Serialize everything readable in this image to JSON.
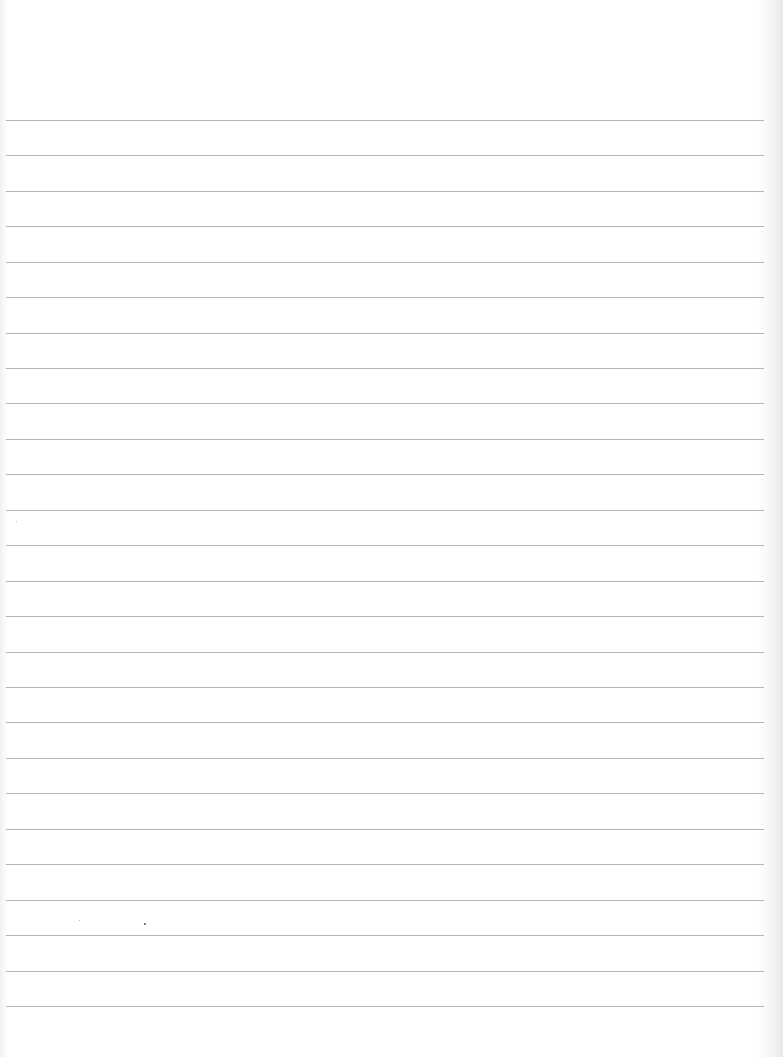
{
  "sheet": {
    "type": "lined-paper",
    "background_color": "#ffffff",
    "rule_color": "#b3b3b3",
    "rule_count": 26,
    "first_rule_y": 120,
    "rule_spacing_px": 35.44,
    "rules": [
      120,
      155,
      191,
      226,
      262,
      297,
      333,
      368,
      403,
      439,
      474,
      510,
      545,
      581,
      616,
      652,
      687,
      722,
      758,
      793,
      829,
      864,
      900,
      935,
      971,
      1006
    ],
    "text": ""
  }
}
